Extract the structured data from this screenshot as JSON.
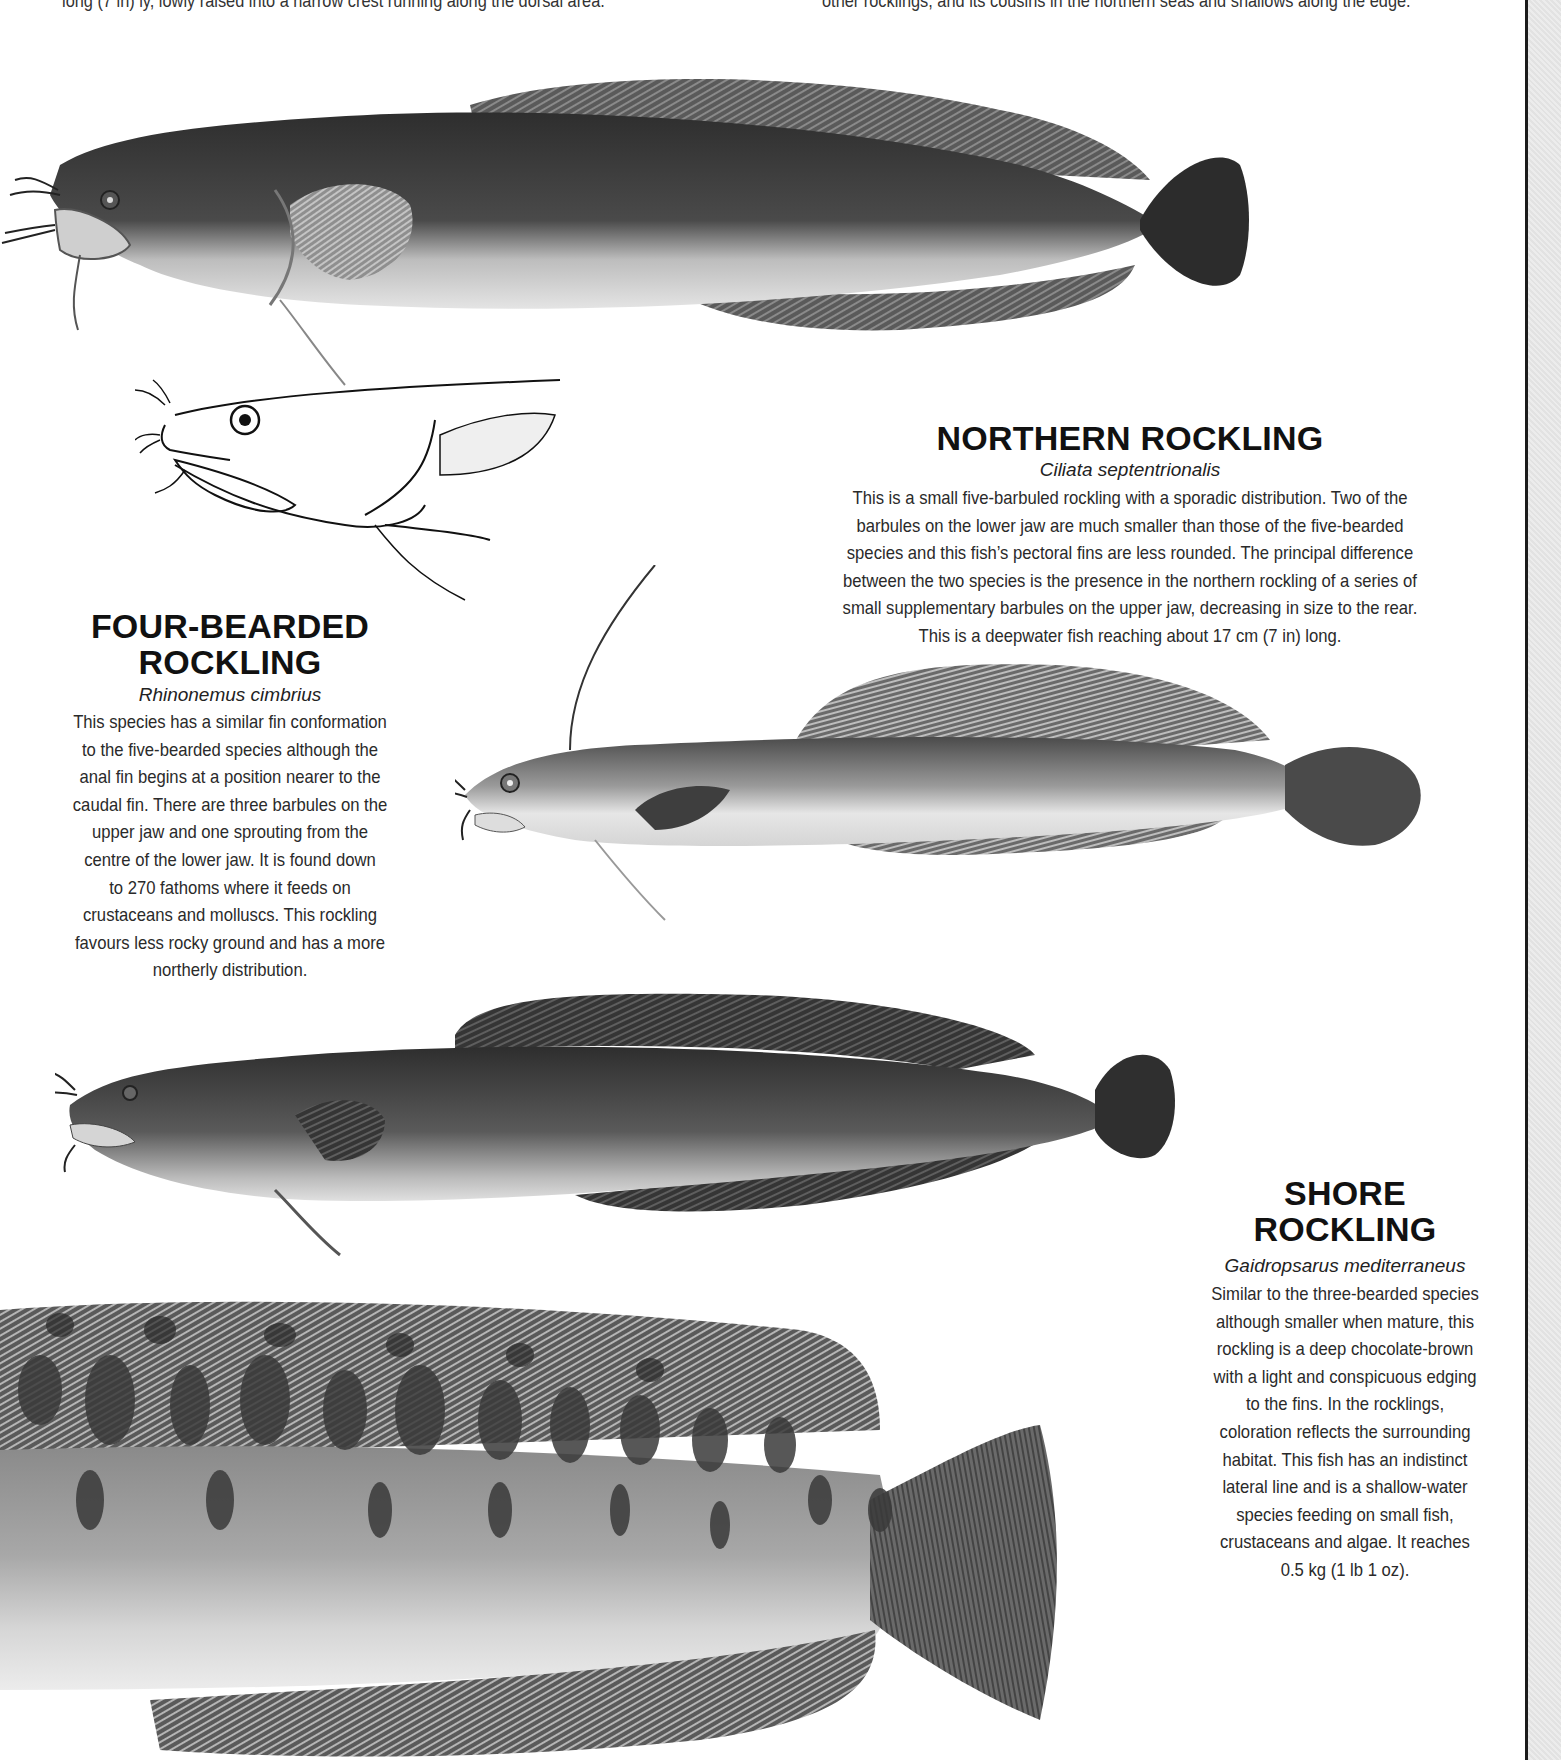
{
  "page": {
    "clipped_top_lines": [
      "long (7 in) ly, lowly raised into a narrow crest running along the dorsal area.",
      "other rocklings, and its cousins in the northern seas and shallows along the edge."
    ]
  },
  "species": [
    {
      "id": "four-bearded",
      "title_lines": [
        "FOUR-BEARDED",
        "ROCKLING"
      ],
      "latin": "Rhinonemus cimbrius",
      "description_lines": [
        "This species has a similar fin conformation",
        "to the five-bearded species although the",
        "anal fin begins at a position nearer to the",
        "caudal fin. There are three barbules on the",
        "upper jaw and one sprouting from the",
        "centre of the lower jaw. It is found down",
        "to 270 fathoms where it feeds on",
        "crustaceans and molluscs. This rockling",
        "favours less rocky ground and has a more",
        "northerly distribution."
      ]
    },
    {
      "id": "northern",
      "title_lines": [
        "NORTHERN ROCKLING"
      ],
      "latin": "Ciliata septentrionalis",
      "description_lines": [
        "This is a small five-barbuled rockling with a sporadic distribution. Two of the",
        "barbules on the lower jaw are much smaller than those of the five-bearded",
        "species and this fish’s pectoral fins are less rounded. The principal difference",
        "between the two species is the presence in the northern rockling of a series of",
        "small supplementary barbules on the upper jaw, decreasing in size to the rear.",
        "This is a deepwater fish reaching about 17 cm (7 in) long."
      ]
    },
    {
      "id": "shore",
      "title_lines": [
        "SHORE",
        "ROCKLING"
      ],
      "latin": "Gaidropsarus mediterraneus",
      "description_lines": [
        "Similar to the three-bearded species",
        "although smaller when mature, this",
        "rockling is a deep chocolate-brown",
        "with a light and conspicuous edging",
        "to the fins. In the rocklings,",
        "coloration reflects the surrounding",
        "habitat. This fish has an indistinct",
        "lateral line and is a shallow-water",
        "species feeding on small fish,",
        "crustaceans and algae. It reaches",
        "0.5 kg (1 lb 1 oz)."
      ]
    }
  ],
  "illustrations": [
    {
      "name": "top-rockling-illustration",
      "style": "dark grey painted"
    },
    {
      "name": "four-bearded-head-line-drawing",
      "style": "line art"
    },
    {
      "name": "northern-rockling-illustration",
      "style": "grey painted"
    },
    {
      "name": "four-bearded-rockling-illustration",
      "style": "dark grey painted"
    },
    {
      "name": "shore-rockling-closeup-illustration",
      "style": "mottled painted"
    }
  ],
  "colors": {
    "page": "#ffffff",
    "text": "#1a1a1a",
    "fish_dark": "#3a3a3a",
    "fish_mid": "#7a7a7a",
    "fish_light": "#d8d8d8",
    "edge": "#1b1b1b",
    "gutter": "#e6e6e6"
  }
}
